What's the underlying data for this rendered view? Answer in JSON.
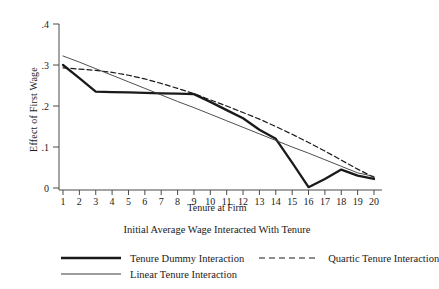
{
  "chart_data": {
    "type": "line",
    "title": "",
    "xlabel": "Tenure at Firm",
    "ylabel": "Effect of First Wage",
    "legend_title": "Initial Average Wage Interacted With Tenure",
    "legend_position": "bottom",
    "grid": false,
    "x": [
      1,
      2,
      3,
      4,
      5,
      6,
      7,
      8,
      9,
      10,
      11,
      12,
      13,
      14,
      15,
      16,
      17,
      18,
      19,
      20
    ],
    "xlim": [
      1,
      20
    ],
    "ylim": [
      0,
      0.4
    ],
    "xticks": [
      "1",
      "2",
      "3",
      "4",
      "5",
      "6",
      "7",
      "8",
      "9",
      "10",
      "11",
      "12",
      "13",
      "14",
      "15",
      "16",
      "17",
      "18",
      "19",
      "20"
    ],
    "yticks": [
      "0",
      ".1",
      ".2",
      ".3",
      ".4"
    ],
    "ytick_values": [
      0,
      0.1,
      0.2,
      0.3,
      0.4
    ],
    "series": [
      {
        "name": "Tenure Dummy Interaction",
        "style": "solid-thick",
        "color": "#1a1a1a",
        "values": [
          0.3,
          0.268,
          0.235,
          0.234,
          0.233,
          0.232,
          0.231,
          0.23,
          0.229,
          0.21,
          0.19,
          0.17,
          0.142,
          0.12,
          0.062,
          0.002,
          0.022,
          0.045,
          0.03,
          0.022
        ]
      },
      {
        "name": "Quartic Tenure Interaction",
        "style": "dashed",
        "color": "#1a1a1a",
        "values": [
          0.293,
          0.29,
          0.287,
          0.282,
          0.275,
          0.266,
          0.255,
          0.243,
          0.23,
          0.215,
          0.2,
          0.184,
          0.168,
          0.15,
          0.131,
          0.111,
          0.09,
          0.068,
          0.046,
          0.026
        ]
      },
      {
        "name": "Linear Tenure Interaction",
        "style": "solid-thin",
        "color": "#3a3a3a",
        "values": [
          0.322,
          0.307,
          0.291,
          0.275,
          0.259,
          0.243,
          0.227,
          0.211,
          0.196,
          0.18,
          0.164,
          0.148,
          0.132,
          0.116,
          0.1,
          0.085,
          0.069,
          0.053,
          0.037,
          0.028
        ]
      }
    ]
  },
  "legend": {
    "title": "Initial Average Wage Interacted With Tenure",
    "entries": [
      {
        "label": "Tenure Dummy Interaction",
        "style": "solid-thick"
      },
      {
        "label": "Quartic Tenure Interaction",
        "style": "dashed"
      },
      {
        "label": "Linear Tenure Interaction",
        "style": "solid-thin"
      }
    ]
  },
  "axes": {
    "x_title": "Tenure at Firm",
    "y_title": "Effect of First Wage"
  }
}
